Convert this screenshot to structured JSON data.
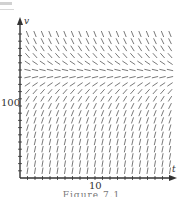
{
  "figure": {
    "caption": "Figure 7.1",
    "axes": {
      "x_label": "t",
      "y_label": "v",
      "x_tick_label": "10",
      "y_tick_label": "100"
    },
    "colors": {
      "axis": "#333333",
      "segment": "#6a6a6a",
      "caption": "#777777"
    }
  },
  "chart_data": {
    "type": "slope_field",
    "title": "",
    "xlabel": "t",
    "ylabel": "v",
    "x_ticks": [
      10
    ],
    "y_ticks": [
      100
    ],
    "xlim": [
      0,
      20
    ],
    "ylim": [
      0,
      200
    ],
    "grid": false,
    "columns": 21,
    "rows": 21,
    "equilibrium_v": 145
  }
}
